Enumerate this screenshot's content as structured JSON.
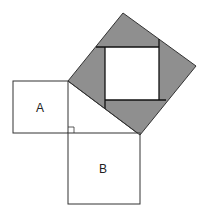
{
  "diagram": {
    "type": "pythagorean-proof",
    "labels": {
      "square_a": "A",
      "square_b": "B"
    },
    "colors": {
      "shade": "#8f8f8f",
      "stroke": "#333333",
      "background": "#ffffff"
    }
  }
}
